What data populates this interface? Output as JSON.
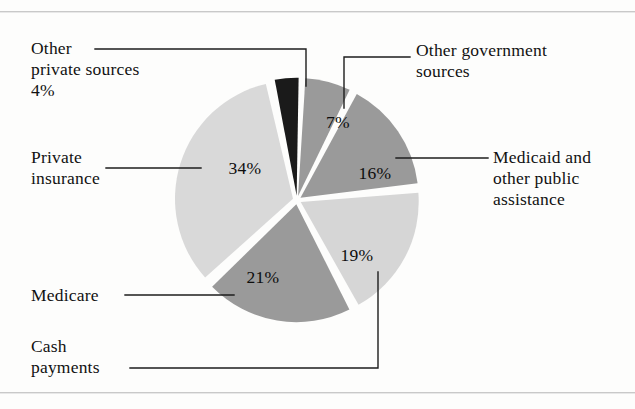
{
  "figure": {
    "type": "pie-chart-figure",
    "background": "#fdfdfc",
    "rule_color": "#c9c9c9"
  },
  "labels": {
    "other_private_sources": "Other\nprivate sources\n4%",
    "private_insurance": "Private\ninsurance",
    "medicare": "Medicare",
    "cash_payments": "Cash\npayments",
    "other_government_sources": "Other government\nsources",
    "medicaid": "Medicaid and\nother public\nassistance"
  },
  "slice_percent_labels": {
    "other_private_sources": "4%",
    "other_government_sources": "7%",
    "medicaid": "16%",
    "cash_payments": "19%",
    "medicare": "21%",
    "private_insurance": "34%"
  },
  "chart_data": {
    "type": "pie",
    "title": "",
    "xlabel": "",
    "ylabel": "",
    "units": "percent",
    "total": 101,
    "legend_position": "callout-labels",
    "grid": false,
    "center": {
      "x": 297,
      "y": 200
    },
    "radius": 118,
    "explode_gap_deg": 2.6,
    "start_angle_deg": -12,
    "direction": "clockwise",
    "categories": [
      "Other private sources",
      "Other government sources",
      "Medicaid and other public assistance",
      "Cash payments",
      "Medicare",
      "Private insurance"
    ],
    "values": [
      4,
      7,
      16,
      19,
      21,
      34
    ],
    "labels": [
      "4%",
      "7%",
      "16%",
      "19%",
      "21%",
      "34%"
    ],
    "colors": [
      "#1a1a1a",
      "#9a9a9a",
      "#9a9a9a",
      "#d6d6d6",
      "#9a9a9a",
      "#d9d9d9"
    ],
    "slices": [
      {
        "name": "Other private sources",
        "value": 4,
        "label": "4%",
        "color": "#1a1a1a",
        "label_pos": null
      },
      {
        "name": "Other government sources",
        "value": 7,
        "label": "7%",
        "color": "#9a9a9a",
        "label_pos": {
          "x": 338,
          "y": 121
        }
      },
      {
        "name": "Medicaid and other public assistance",
        "value": 16,
        "label": "16%",
        "color": "#9a9a9a",
        "label_pos": {
          "x": 374,
          "y": 172
        }
      },
      {
        "name": "Cash payments",
        "value": 19,
        "label": "19%",
        "color": "#d6d6d6",
        "label_pos": {
          "x": 358,
          "y": 255
        }
      },
      {
        "name": "Medicare",
        "value": 21,
        "label": "21%",
        "color": "#9a9a9a",
        "label_pos": {
          "x": 262,
          "y": 276
        }
      },
      {
        "name": "Private insurance",
        "value": 34,
        "label": "34%",
        "color": "#d9d9d9",
        "label_pos": {
          "x": 245,
          "y": 167
        }
      }
    ]
  }
}
